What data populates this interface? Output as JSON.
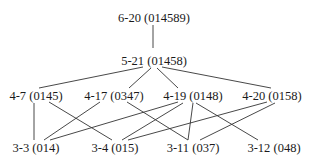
{
  "nodes": [
    {
      "id": "n6-20",
      "label": "6-20 (014589)",
      "x": 154,
      "y": 22
    },
    {
      "id": "n5-21",
      "label": "5-21 (01458)",
      "x": 154,
      "y": 65
    },
    {
      "id": "n4-7",
      "label": "4-7 (0145)",
      "x": 36,
      "y": 110
    },
    {
      "id": "n4-17",
      "label": "4-17 (0347)",
      "x": 114,
      "y": 110
    },
    {
      "id": "n4-19",
      "label": "4-19 (0148)",
      "x": 193,
      "y": 110
    },
    {
      "id": "n4-20",
      "label": "4-20 (0158)",
      "x": 272,
      "y": 110
    },
    {
      "id": "n3-3",
      "label": "3-3 (014)",
      "x": 36,
      "y": 159
    },
    {
      "id": "n3-4",
      "label": "3-4 (015)",
      "x": 115,
      "y": 159
    },
    {
      "id": "n3-11",
      "label": "3-11 (037)",
      "x": 193,
      "y": 159
    },
    {
      "id": "n3-12",
      "label": "3-12 (048)",
      "x": 274,
      "y": 159
    }
  ],
  "edges": [
    {
      "from": "6-20",
      "to": "5-21",
      "x1": 153,
      "y1": 25,
      "x2": 153,
      "y2": 48
    },
    {
      "from": "5-21",
      "to": "4-7",
      "x1": 143,
      "y1": 67,
      "x2": 39,
      "y2": 88
    },
    {
      "from": "5-21",
      "to": "4-17",
      "x1": 151,
      "y1": 68,
      "x2": 129,
      "y2": 88
    },
    {
      "from": "5-21",
      "to": "4-19",
      "x1": 157,
      "y1": 68,
      "x2": 178,
      "y2": 88
    },
    {
      "from": "5-21",
      "to": "4-20",
      "x1": 162,
      "y1": 67,
      "x2": 271,
      "y2": 88
    },
    {
      "from": "4-7",
      "to": "3-3",
      "x1": 34,
      "y1": 103,
      "x2": 34,
      "y2": 140
    },
    {
      "from": "4-7",
      "to": "3-4",
      "x1": 49,
      "y1": 102,
      "x2": 112,
      "y2": 140
    },
    {
      "from": "4-17",
      "to": "3-3",
      "x1": 100,
      "y1": 102,
      "x2": 44,
      "y2": 140
    },
    {
      "from": "4-17",
      "to": "3-11",
      "x1": 127,
      "y1": 102,
      "x2": 188,
      "y2": 140
    },
    {
      "from": "4-19",
      "to": "3-3",
      "x1": 178,
      "y1": 102,
      "x2": 50,
      "y2": 140
    },
    {
      "from": "4-19",
      "to": "3-4",
      "x1": 183,
      "y1": 103,
      "x2": 122,
      "y2": 140
    },
    {
      "from": "4-19",
      "to": "3-11",
      "x1": 193,
      "y1": 103,
      "x2": 188,
      "y2": 140
    },
    {
      "from": "4-19",
      "to": "3-12",
      "x1": 196,
      "y1": 103,
      "x2": 258,
      "y2": 140
    },
    {
      "from": "4-20",
      "to": "3-4",
      "x1": 267,
      "y1": 102,
      "x2": 128,
      "y2": 140
    },
    {
      "from": "4-20",
      "to": "3-11",
      "x1": 275,
      "y1": 103,
      "x2": 200,
      "y2": 140
    }
  ]
}
